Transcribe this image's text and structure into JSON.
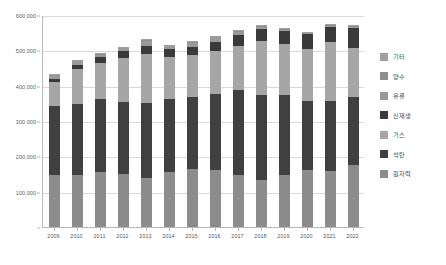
{
  "chart_data": {
    "type": "bar",
    "stacked": true,
    "title": "",
    "xlabel": "",
    "ylabel": "",
    "ylim": [
      0,
      600000
    ],
    "ytick_values": [
      0,
      100000,
      200000,
      300000,
      400000,
      500000,
      600000
    ],
    "ytick_labels": [
      "",
      "100,000",
      "200,000",
      "300,000",
      "400,000",
      "500,000",
      "600,000"
    ],
    "grid": true,
    "legend_position": "right",
    "categories": [
      "2009",
      "2010",
      "2011",
      "2012",
      "2013",
      "2014",
      "2015",
      "2016",
      "2017",
      "2018",
      "2019",
      "2020",
      "2021",
      "2022"
    ],
    "series": [
      {
        "name": "원자력",
        "color": "#8c8c8c",
        "values": [
          147771,
          148596,
          154723,
          150327,
          138784,
          156407,
          164762,
          161995,
          148427,
          133505,
          145910,
          160184,
          158015,
          176054
        ]
      },
      {
        "name": "석탄",
        "color": "#404040",
        "values": [
          193658,
          200112,
          206546,
          203027,
          212648,
          207214,
          204230,
          213803,
          238799,
          238967,
          227384,
          196333,
          197966,
          193231
        ]
      },
      {
        "name": "가스",
        "color": "#a6a6a6",
        "values": [
          69572,
          98156,
          102484,
          125285,
          139000,
          117756,
          118695,
          121018,
          126039,
          152924,
          144355,
          145911,
          168297,
          136414
        ]
      },
      {
        "name": "신재생",
        "color": "#3a3a3a",
        "values": [
          9093,
          12990,
          17345,
          19498,
          21000,
          22000,
          23000,
          25836,
          30818,
          35598,
          36392,
          43085,
          43096,
          57015
        ]
      },
      {
        "name": "유류",
        "color": "#9a9a9a",
        "values": [
          11090,
          9165,
          6753,
          7281,
          15000,
          8000,
          10000,
          14000,
          8431,
          5740,
          3292,
          2255,
          2250,
          2400
        ]
      },
      {
        "name": "양수",
        "color": "#8f8f8f",
        "values": [
          2533,
          3209,
          3632,
          3671,
          3800,
          3800,
          3800,
          3787,
          4293,
          3911,
          3458,
          3271,
          3587,
          3610
        ]
      },
      {
        "name": "기타",
        "color": "#a0a0a0",
        "values": [
          700,
          800,
          900,
          1000,
          1100,
          1200,
          1300,
          1400,
          1500,
          1600,
          1700,
          1800,
          1900,
          2000
        ]
      }
    ],
    "stack_order_bottom_to_top": [
      "원자력",
      "석탄",
      "가스",
      "신재생",
      "유류",
      "양수",
      "기타"
    ],
    "totals": [
      434417,
      473028,
      492383,
      510089,
      531332,
      516377,
      525787,
      541839,
      558307,
      572245,
      562491,
      552839,
      575111,
      570724
    ]
  },
  "legend": {
    "items": [
      {
        "label": "기타",
        "color": "#a0a0a0"
      },
      {
        "label": "양수",
        "color": "#8f8f8f"
      },
      {
        "label": "유류",
        "color": "#9a9a9a"
      },
      {
        "label": "신재생",
        "color": "#3a3a3a"
      },
      {
        "label": "가스",
        "color": "#a6a6a6"
      },
      {
        "label": "석탄",
        "color": "#404040"
      },
      {
        "label": "원자력",
        "color": "#8c8c8c"
      }
    ]
  }
}
